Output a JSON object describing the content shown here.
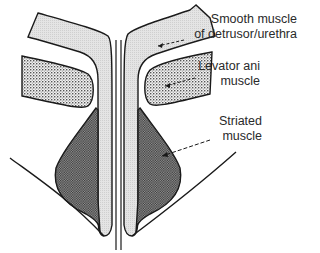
{
  "diagram": {
    "type": "anatomical cross-section",
    "colors": {
      "smooth_muscle_fill": "#d9d9d9",
      "levator_ani_fill": "#b8b8b8",
      "striated_muscle_fill": "#6e6e6e",
      "outline": "#1a1a1a",
      "background": "#ffffff"
    },
    "labels": [
      {
        "id": "smooth-muscle",
        "line1": "Smooth muscle",
        "line2": "of detrusor/urethra"
      },
      {
        "id": "levator-ani",
        "line1": "Levator ani",
        "line2": "muscle"
      },
      {
        "id": "striated-muscle",
        "line1": "Striated",
        "line2": "muscle"
      }
    ]
  }
}
